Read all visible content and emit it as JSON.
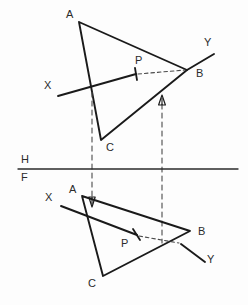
{
  "figure": {
    "canvas": {
      "width": 248,
      "height": 305
    },
    "ink_color": "#1a1a1a",
    "paper_color": "#fdfdfd",
    "hidden_line_color": "#4a4a4a",
    "fold_line_color": "#2b2b2b"
  },
  "fold_line": {
    "name": "H/F reference line",
    "upper_label": "H",
    "lower_label": "F",
    "y": 169,
    "x_start": 18,
    "x_end": 238,
    "upper_label_pos": {
      "x": 21,
      "y": 153
    },
    "lower_label_pos": {
      "x": 21,
      "y": 172
    }
  },
  "top_view": {
    "name": "horizontal projection",
    "triangle": {
      "label": "ABC",
      "vertices": [
        {
          "label": "A",
          "x": 79,
          "y": 22,
          "label_pos": {
            "x": 66,
            "y": 9
          }
        },
        {
          "label": "B",
          "x": 187,
          "y": 70,
          "label_pos": {
            "x": 196,
            "y": 71
          }
        },
        {
          "label": "C",
          "x": 101,
          "y": 140,
          "label_pos": {
            "x": 106,
            "y": 144
          }
        }
      ]
    },
    "line_xy": {
      "label": "XY",
      "x_label": "X",
      "y_label": "Y",
      "x_end": {
        "x": 58,
        "y": 96
      },
      "y_end": {
        "x": 214,
        "y": 54
      },
      "x_label_pos": {
        "x": 44,
        "y": 81
      },
      "y_label_pos": {
        "x": 204,
        "y": 37
      },
      "visible_to": {
        "x": 136,
        "y": 74
      },
      "hidden_from": {
        "x": 136,
        "y": 74
      },
      "hidden_to": {
        "x": 187,
        "y": 70
      }
    },
    "piercing_point": {
      "label": "P",
      "x": 137,
      "y": 74,
      "label_pos": {
        "x": 135,
        "y": 55
      }
    },
    "projectors": [
      {
        "name": "projector-a",
        "x": 92,
        "y_top": 92,
        "y_bottom": 196
      },
      {
        "name": "projector-p",
        "x": 162,
        "y_top": 105,
        "y_bottom": 243
      }
    ],
    "arrow_markers": [
      {
        "name": "arrow-up-bc",
        "x": 162,
        "y": 96
      }
    ]
  },
  "front_view": {
    "name": "frontal projection",
    "triangle": {
      "label": "ABC",
      "vertices": [
        {
          "label": "A",
          "x": 82,
          "y": 196,
          "label_pos": {
            "x": 69,
            "y": 185
          }
        },
        {
          "label": "B",
          "x": 190,
          "y": 231,
          "label_pos": {
            "x": 198,
            "y": 229
          }
        },
        {
          "label": "C",
          "x": 103,
          "y": 276,
          "label_pos": {
            "x": 88,
            "y": 279
          }
        }
      ]
    },
    "line_xy": {
      "label": "XY",
      "x_label": "X",
      "y_label": "Y",
      "x_end": {
        "x": 61,
        "y": 206
      },
      "y_end": {
        "x": 205,
        "y": 262
      },
      "x_label_pos": {
        "x": 47,
        "y": 193
      },
      "y_label_pos": {
        "x": 208,
        "y": 255
      },
      "visible_to": {
        "x": 137,
        "y": 235
      },
      "hidden_from": {
        "x": 137,
        "y": 235
      },
      "hidden_to": {
        "x": 181,
        "y": 244
      }
    },
    "piercing_point": {
      "label": "P",
      "x": 181,
      "y": 244,
      "label_pos": {
        "x": 122,
        "y": 238
      }
    },
    "arrow_markers": [
      {
        "name": "arrow-down-ab",
        "x": 92,
        "y": 202
      }
    ]
  },
  "annotations": {
    "tick_marks": [
      {
        "name": "tick-top-view",
        "x": 136,
        "y": 74
      },
      {
        "name": "tick-front-view",
        "x": 137,
        "y": 235
      }
    ]
  }
}
